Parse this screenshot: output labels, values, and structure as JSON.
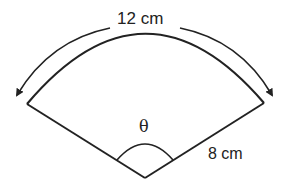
{
  "diagram": {
    "type": "sector",
    "arc_length_label": "12 cm",
    "radius_label": "8 cm",
    "angle_label": "θ",
    "stroke_color": "#222222"
  }
}
